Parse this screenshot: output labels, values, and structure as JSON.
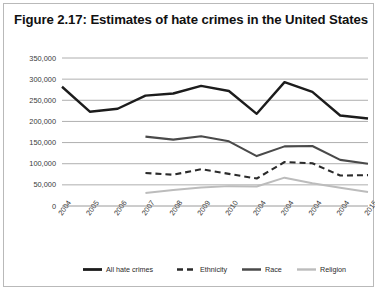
{
  "figure": {
    "title": "Figure 2.17: Estimates of hate crimes in the United States"
  },
  "chart_data": {
    "type": "line",
    "title": "Figure 2.17: Estimates of hate crimes in the United States",
    "xlabel": "",
    "ylabel": "",
    "ylim": [
      0,
      350000
    ],
    "ytick_labels": [
      "350,000",
      "300,000",
      "250,000",
      "200,000",
      "150,000",
      "100,000",
      "50,000",
      "0"
    ],
    "ytick_values": [
      350000,
      300000,
      250000,
      200000,
      150000,
      100000,
      50000,
      0
    ],
    "grid": true,
    "legend_position": "bottom",
    "categories": [
      "2004",
      "2005",
      "2006",
      "2007",
      "2008",
      "2009",
      "2010",
      "2004",
      "2004",
      "2004",
      "2004",
      "2015"
    ],
    "series": [
      {
        "name": "All hate crimes",
        "style": "solid",
        "color": "#1c1c1c",
        "width": 2.4,
        "values": [
          282000,
          223000,
          230000,
          261000,
          266000,
          284000,
          272000,
          218000,
          293000,
          270000,
          214000,
          207000
        ]
      },
      {
        "name": "Ethnicity",
        "style": "dashed",
        "color": "#2b2b2b",
        "width": 2.1,
        "values": [
          null,
          null,
          null,
          78000,
          74000,
          87000,
          76000,
          65000,
          104000,
          101000,
          72000,
          73000
        ]
      },
      {
        "name": "Race",
        "style": "solid",
        "color": "#4a4a4a",
        "width": 2.1,
        "values": [
          null,
          null,
          null,
          164000,
          157000,
          165000,
          153000,
          118000,
          141000,
          142000,
          109000,
          100000
        ]
      },
      {
        "name": "Religion",
        "style": "solid",
        "color": "#bcbcbc",
        "width": 2.0,
        "values": [
          null,
          null,
          null,
          31000,
          38000,
          44000,
          47000,
          46000,
          67000,
          54000,
          43000,
          33000
        ]
      }
    ]
  },
  "legend": {
    "items": [
      {
        "label": "All hate crimes",
        "swatch": "solid-dark"
      },
      {
        "label": "Ethnicity",
        "swatch": "dashed-dark"
      },
      {
        "label": "Race",
        "swatch": "solid-gray"
      },
      {
        "label": "Religion",
        "swatch": "solid-lightgray"
      }
    ]
  }
}
